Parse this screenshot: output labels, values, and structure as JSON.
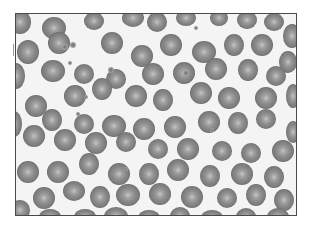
{
  "image": {
    "subject": "blood smear micrograph",
    "alt": "Grayscale micrograph of a peripheral blood smear showing numerous red blood cells with central pallor and a few platelets",
    "frame": {
      "x": 15,
      "y": 13,
      "width": 282,
      "height": 203,
      "border_color": "#4a4a4a"
    },
    "colors": {
      "background": "#f3f3f3",
      "cell_edge": "#6e6e6e",
      "cell_body": "#8c8c8c",
      "cell_center": "#c4c4c4",
      "platelet": "#7a7a7a"
    }
  },
  "cells": [
    [
      4,
      8,
      11,
      12
    ],
    [
      38,
      14,
      12,
      11
    ],
    [
      78,
      7,
      10,
      9
    ],
    [
      117,
      4,
      11,
      9
    ],
    [
      141,
      8,
      10,
      10
    ],
    [
      170,
      4,
      10,
      8
    ],
    [
      203,
      4,
      9,
      8
    ],
    [
      231,
      6,
      10,
      9
    ],
    [
      258,
      8,
      10,
      9
    ],
    [
      276,
      22,
      9,
      12
    ],
    [
      12,
      38,
      11,
      12
    ],
    [
      43,
      29,
      11,
      11
    ],
    [
      96,
      29,
      11,
      11
    ],
    [
      126,
      42,
      11,
      11
    ],
    [
      155,
      31,
      11,
      11
    ],
    [
      188,
      38,
      12,
      11
    ],
    [
      218,
      31,
      10,
      11
    ],
    [
      246,
      31,
      11,
      11
    ],
    [
      272,
      48,
      9,
      11
    ],
    [
      0,
      62,
      9,
      13
    ],
    [
      37,
      57,
      12,
      11
    ],
    [
      68,
      60,
      10,
      10
    ],
    [
      100,
      65,
      10,
      10
    ],
    [
      137,
      60,
      11,
      11
    ],
    [
      168,
      59,
      11,
      11
    ],
    [
      200,
      55,
      11,
      11
    ],
    [
      232,
      56,
      10,
      11
    ],
    [
      260,
      62,
      10,
      10
    ],
    [
      -2,
      110,
      8,
      13
    ],
    [
      20,
      92,
      11,
      11
    ],
    [
      59,
      82,
      11,
      11
    ],
    [
      86,
      75,
      10,
      11
    ],
    [
      120,
      82,
      11,
      11
    ],
    [
      147,
      86,
      10,
      11
    ],
    [
      185,
      79,
      11,
      11
    ],
    [
      213,
      84,
      11,
      11
    ],
    [
      250,
      84,
      11,
      11
    ],
    [
      277,
      82,
      7,
      12
    ],
    [
      36,
      106,
      10,
      11
    ],
    [
      68,
      110,
      10,
      10
    ],
    [
      98,
      112,
      12,
      11
    ],
    [
      128,
      115,
      11,
      11
    ],
    [
      159,
      113,
      11,
      11
    ],
    [
      193,
      108,
      11,
      11
    ],
    [
      222,
      109,
      10,
      11
    ],
    [
      250,
      105,
      10,
      10
    ],
    [
      277,
      118,
      7,
      11
    ],
    [
      18,
      122,
      11,
      11
    ],
    [
      49,
      126,
      11,
      11
    ],
    [
      80,
      129,
      11,
      11
    ],
    [
      110,
      128,
      10,
      10
    ],
    [
      142,
      135,
      10,
      10
    ],
    [
      172,
      135,
      11,
      11
    ],
    [
      206,
      137,
      10,
      10
    ],
    [
      235,
      139,
      10,
      10
    ],
    [
      267,
      137,
      11,
      11
    ],
    [
      12,
      158,
      11,
      11
    ],
    [
      42,
      158,
      11,
      11
    ],
    [
      73,
      150,
      10,
      11
    ],
    [
      103,
      160,
      11,
      11
    ],
    [
      133,
      160,
      10,
      11
    ],
    [
      162,
      156,
      11,
      11
    ],
    [
      194,
      162,
      10,
      11
    ],
    [
      226,
      160,
      11,
      11
    ],
    [
      258,
      163,
      10,
      11
    ],
    [
      28,
      184,
      11,
      11
    ],
    [
      58,
      177,
      11,
      10
    ],
    [
      84,
      183,
      10,
      11
    ],
    [
      112,
      181,
      12,
      11
    ],
    [
      144,
      180,
      11,
      11
    ],
    [
      176,
      183,
      11,
      11
    ],
    [
      211,
      184,
      10,
      10
    ],
    [
      240,
      181,
      10,
      11
    ],
    [
      268,
      186,
      10,
      11
    ],
    [
      4,
      196,
      10,
      10
    ],
    [
      34,
      203,
      11,
      8
    ],
    [
      69,
      203,
      11,
      8
    ],
    [
      100,
      202,
      12,
      9
    ],
    [
      133,
      204,
      11,
      8
    ],
    [
      164,
      202,
      10,
      9
    ],
    [
      196,
      204,
      11,
      8
    ],
    [
      230,
      203,
      10,
      9
    ],
    [
      262,
      203,
      11,
      9
    ]
  ],
  "platelets": [
    [
      49,
      33,
      3
    ],
    [
      57,
      31,
      3
    ],
    [
      95,
      56,
      3
    ],
    [
      54,
      49,
      2
    ],
    [
      62,
      100,
      2
    ],
    [
      170,
      59,
      3
    ],
    [
      196,
      116,
      2
    ],
    [
      180,
      14,
      2
    ],
    [
      70,
      83,
      2
    ],
    [
      110,
      155,
      2
    ]
  ]
}
